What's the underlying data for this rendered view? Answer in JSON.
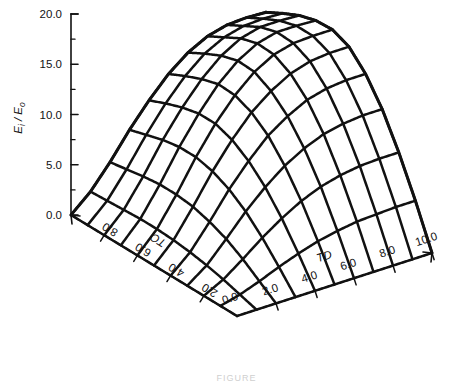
{
  "figure": {
    "background": "#ffffff",
    "ink": "#111111",
    "caption": "FIGURE"
  },
  "chart_data": {
    "type": "line",
    "plot_kind": "3d-wireframe-surface",
    "title": "",
    "zlabel": "E i / E o",
    "zlabel_parts": {
      "main1": "E",
      "sub1": "i",
      "slash": "/",
      "main2": "E",
      "sub2": "o"
    },
    "xlabel": "TC",
    "ylabel": "TD",
    "zlim": [
      0.0,
      20.0
    ],
    "z_major_ticks": [
      "0.0",
      "5.0",
      "10.0",
      "15.0",
      "20.0"
    ],
    "z_major_values": [
      0.0,
      5.0,
      10.0,
      15.0,
      20.0
    ],
    "z_minor_count_between": 1,
    "xlim": [
      0.0,
      10.0
    ],
    "x_ticks": [
      "2.0",
      "4.0",
      "6.0",
      "8.0"
    ],
    "x_tick_values": [
      2.0,
      4.0,
      6.0,
      8.0
    ],
    "ylim": [
      0.0,
      10.0
    ],
    "y_ticks": [
      "0.0",
      "2.0",
      "4.0",
      "6.0",
      "8.0",
      "10.0"
    ],
    "y_tick_values": [
      0.0,
      2.0,
      4.0,
      6.0,
      8.0,
      10.0
    ],
    "origin_label": "0.0",
    "grid": false,
    "legend": false,
    "mesh_rows": 10,
    "mesh_cols": 10,
    "surface_max": 16.2,
    "surface_min": 0.0,
    "series": [
      {
        "name": "E_i/E_o surface",
        "x": [
          0,
          1,
          2,
          3,
          4,
          5,
          6,
          7,
          8,
          9,
          10
        ],
        "y": [
          0,
          1,
          2,
          3,
          4,
          5,
          6,
          7,
          8,
          9,
          10
        ],
        "z": [
          [
            0.0,
            0.0,
            0.0,
            0.0,
            0.0,
            0.0,
            0.0,
            0.0,
            0.0,
            0.0,
            0.0
          ],
          [
            0.0,
            0.5,
            1.2,
            2.0,
            2.7,
            3.3,
            3.7,
            4.0,
            4.1,
            4.2,
            4.2
          ],
          [
            0.0,
            1.0,
            2.4,
            3.9,
            5.2,
            6.3,
            7.1,
            7.6,
            7.9,
            8.0,
            8.0
          ],
          [
            0.0,
            1.4,
            3.4,
            5.5,
            7.3,
            8.8,
            9.9,
            10.7,
            11.1,
            11.3,
            11.3
          ],
          [
            0.0,
            1.7,
            4.1,
            6.7,
            8.9,
            10.8,
            12.1,
            13.1,
            13.6,
            13.8,
            13.8
          ],
          [
            0.0,
            1.9,
            4.6,
            7.5,
            10.0,
            12.1,
            13.6,
            14.7,
            15.3,
            15.5,
            15.5
          ],
          [
            0.0,
            2.0,
            4.8,
            7.9,
            10.6,
            12.8,
            14.5,
            15.6,
            16.1,
            16.2,
            16.2
          ],
          [
            0.0,
            2.0,
            4.8,
            7.9,
            10.6,
            12.9,
            14.6,
            15.7,
            16.2,
            16.2,
            16.1
          ],
          [
            0.0,
            1.9,
            4.6,
            7.6,
            10.2,
            12.4,
            14.1,
            15.2,
            15.7,
            15.7,
            15.6
          ],
          [
            0.0,
            1.8,
            4.3,
            7.1,
            9.6,
            11.7,
            13.3,
            14.3,
            14.8,
            14.9,
            14.8
          ],
          [
            0.0,
            1.7,
            4.0,
            6.6,
            8.9,
            10.9,
            12.4,
            13.4,
            13.9,
            14.0,
            13.9
          ]
        ]
      }
    ]
  }
}
